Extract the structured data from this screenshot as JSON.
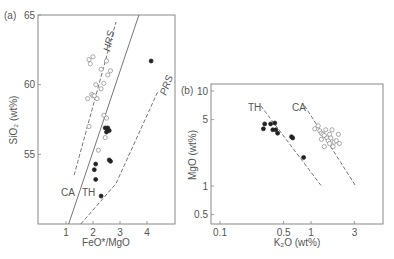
{
  "chart_data": [
    {
      "panel": "(a)",
      "type": "scatter",
      "xlabel": "FeO*/MgO",
      "ylabel": "SiO2 (wt%)",
      "xlim": [
        0,
        5
      ],
      "ylim": [
        50,
        65
      ],
      "xticks": [
        1,
        2,
        3,
        4
      ],
      "yticks": [
        55,
        60,
        65
      ],
      "grid": false,
      "series": [
        {
          "name": "CA (open circles)",
          "marker": "open-circle",
          "points": [
            [
              1.85,
              61.8
            ],
            [
              1.9,
              61.5
            ],
            [
              2.0,
              62.0
            ],
            [
              2.3,
              61.1
            ],
            [
              2.5,
              61.7
            ],
            [
              2.4,
              60.1
            ],
            [
              2.1,
              60.0
            ],
            [
              2.55,
              60.7
            ],
            [
              2.65,
              61.0
            ],
            [
              2.15,
              59.0
            ],
            [
              1.95,
              59.3
            ],
            [
              2.0,
              59.2
            ],
            [
              2.05,
              59.2
            ],
            [
              1.8,
              59.0
            ],
            [
              2.3,
              59.7
            ],
            [
              2.4,
              57.8
            ],
            [
              2.5,
              57.6
            ],
            [
              1.85,
              57.0
            ],
            [
              2.45,
              56.2
            ],
            [
              2.2,
              55.3
            ]
          ]
        },
        {
          "name": "TH (filled circles)",
          "marker": "filled-circle",
          "points": [
            [
              4.15,
              61.7
            ],
            [
              2.45,
              56.9
            ],
            [
              2.55,
              56.9
            ],
            [
              2.5,
              56.6
            ],
            [
              2.6,
              56.7
            ],
            [
              2.1,
              54.3
            ],
            [
              2.05,
              53.9
            ],
            [
              2.1,
              53.2
            ],
            [
              2.6,
              54.6
            ],
            [
              2.65,
              54.5
            ],
            [
              2.3,
              52.0
            ]
          ]
        }
      ],
      "lines": [
        {
          "name": "CA/TH boundary",
          "style": "solid",
          "points": [
            [
              1.1,
              50
            ],
            [
              3.7,
              65
            ]
          ]
        },
        {
          "name": "HRS",
          "style": "dashed",
          "points": [
            [
              1.3,
              53.5
            ],
            [
              2.85,
              64.5
            ]
          ]
        },
        {
          "name": "PRS",
          "style": "dashed",
          "points": [
            [
              1.55,
              50
            ],
            [
              2.85,
              52.9
            ],
            [
              4.4,
              59.5
            ]
          ]
        }
      ],
      "annotations": [
        "HRS",
        "PRS",
        "CA",
        "TH"
      ]
    },
    {
      "panel": "(b)",
      "type": "scatter",
      "xlabel": "K2O (wt%)",
      "ylabel": "MgO (wt%)",
      "xscale": "log",
      "yscale": "log",
      "xlim": [
        0.08,
        5
      ],
      "ylim": [
        0.4,
        12
      ],
      "xticks": [
        0.1,
        0.5,
        1,
        3
      ],
      "yticks": [
        0.5,
        1,
        5,
        10
      ],
      "grid": false,
      "series": [
        {
          "name": "TH (filled circles)",
          "marker": "filled-circle",
          "points": [
            [
              0.3,
              4.0
            ],
            [
              0.31,
              4.5
            ],
            [
              0.36,
              4.5
            ],
            [
              0.38,
              3.9
            ],
            [
              0.4,
              4.6
            ],
            [
              0.41,
              3.9
            ],
            [
              0.43,
              3.6
            ],
            [
              0.61,
              3.3
            ],
            [
              0.63,
              3.2
            ],
            [
              0.83,
              2.0
            ]
          ]
        },
        {
          "name": "CA (open circles)",
          "marker": "open-circle",
          "points": [
            [
              1.1,
              4.0
            ],
            [
              1.2,
              4.3
            ],
            [
              1.25,
              3.8
            ],
            [
              1.3,
              3.6
            ],
            [
              1.35,
              3.5
            ],
            [
              1.4,
              3.4
            ],
            [
              1.45,
              3.9
            ],
            [
              1.5,
              3.2
            ],
            [
              1.55,
              3.0
            ],
            [
              1.6,
              3.5
            ],
            [
              1.6,
              2.8
            ],
            [
              1.65,
              3.2
            ],
            [
              1.7,
              3.9
            ],
            [
              1.75,
              2.6
            ],
            [
              1.8,
              2.9
            ],
            [
              1.9,
              3.0
            ],
            [
              2.0,
              3.5
            ],
            [
              2.05,
              2.8
            ],
            [
              1.4,
              2.6
            ],
            [
              1.3,
              3.1
            ]
          ]
        }
      ],
      "lines": [
        {
          "name": "TH trend",
          "style": "dashed",
          "points": [
            [
              0.28,
              7.0
            ],
            [
              1.3,
              1.0
            ]
          ]
        },
        {
          "name": "CA trend",
          "style": "dashed",
          "points": [
            [
              0.85,
              7.0
            ],
            [
              3.1,
              1.0
            ]
          ]
        }
      ],
      "annotations": [
        "TH",
        "CA"
      ]
    }
  ],
  "labels": {
    "panel_a": "(a)",
    "panel_b": "(b)",
    "a_xlabel": "FeO*/MgO",
    "a_ylabel": "SiO₂ (wt%)",
    "b_xlabel": "K₂O (wt%)",
    "b_ylabel": "MgO (wt%)",
    "hrs": "HRS",
    "prs": "PRS",
    "ca": "CA",
    "th": "TH",
    "a_xticks": [
      "1",
      "2",
      "3",
      "4"
    ],
    "a_yticks": [
      "55",
      "60",
      "65"
    ],
    "b_xticks": [
      "0.1",
      "0.5",
      "1",
      "3"
    ],
    "b_yticks": [
      "0.5",
      "1",
      "5",
      "10"
    ]
  },
  "colors": {
    "axis": "#777777",
    "text": "#555555",
    "marker": "#222222",
    "open_marker": "#888888"
  }
}
